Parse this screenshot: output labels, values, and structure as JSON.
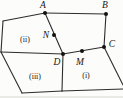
{
  "figure": {
    "colors": {
      "background": "#fcfcfb",
      "line": "#2d2d2d",
      "dot": "#121212",
      "label": "#161616"
    },
    "line_width": 1.1,
    "dot_radius": 2,
    "points": [
      {
        "id": "A",
        "label": "A",
        "x": 45,
        "y": 13,
        "lx": 43,
        "ly": 8,
        "dot": true
      },
      {
        "id": "B",
        "label": "B",
        "x": 106,
        "y": 14,
        "lx": 105,
        "ly": 8,
        "dot": true
      },
      {
        "id": "N",
        "label": "N",
        "x": 54,
        "y": 35,
        "lx": 46,
        "ly": 38,
        "dot": true
      },
      {
        "id": "C",
        "label": "C",
        "x": 104,
        "y": 47,
        "lx": 112,
        "ly": 47,
        "dot": true
      },
      {
        "id": "D",
        "label": "D",
        "x": 63,
        "y": 54,
        "lx": 57,
        "ly": 65,
        "dot": true
      },
      {
        "id": "M",
        "label": "M",
        "x": 82,
        "y": 51,
        "lx": 80,
        "ly": 65,
        "dot": true
      },
      {
        "id": "P1",
        "label": "",
        "x": 3,
        "y": 21,
        "dot": false
      },
      {
        "id": "P2",
        "label": "",
        "x": 1,
        "y": 52,
        "dot": false
      },
      {
        "id": "P3",
        "label": "",
        "x": 22,
        "y": 93,
        "dot": false
      },
      {
        "id": "P4",
        "label": "",
        "x": 62,
        "y": 91,
        "dot": false
      },
      {
        "id": "P5",
        "label": "",
        "x": 123,
        "y": 89,
        "dot": false
      },
      {
        "id": "P6",
        "label": "",
        "x": 123,
        "y": 85,
        "dot": false
      }
    ],
    "edges": [
      [
        "P1",
        "A"
      ],
      [
        "A",
        "B"
      ],
      [
        "B",
        "C"
      ],
      [
        "A",
        "D"
      ],
      [
        "D",
        "C"
      ],
      [
        "P1",
        "P2"
      ],
      [
        "P2",
        "D"
      ],
      [
        "P2",
        "P3"
      ],
      [
        "P3",
        "P4"
      ],
      [
        "D",
        "P4"
      ],
      [
        "P4",
        "P5"
      ],
      [
        "C",
        "P6"
      ]
    ],
    "regions": [
      {
        "id": "ii",
        "label": "(ii)",
        "x": 25,
        "y": 42
      },
      {
        "id": "iii",
        "label": "(iii)",
        "x": 35,
        "y": 79
      },
      {
        "id": "i",
        "label": "(i)",
        "x": 86,
        "y": 78
      }
    ]
  }
}
